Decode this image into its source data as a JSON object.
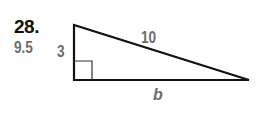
{
  "problem": {
    "number": "28.",
    "answer": "9.5"
  },
  "triangle": {
    "type": "right-triangle",
    "labels": {
      "vertical_leg": "3",
      "hypotenuse": "10",
      "horizontal_leg": "b"
    },
    "colors": {
      "stroke": "#111111",
      "label": "#6d6d6d"
    }
  }
}
